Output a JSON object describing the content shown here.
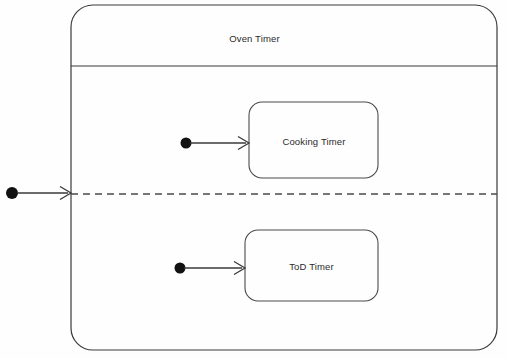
{
  "diagram": {
    "type": "uml-state-machine",
    "title": "Oven Timer",
    "background_color": "#fefefe",
    "stroke_color": "#3a3a3a",
    "text_color": "#2b2b2b",
    "composite_state": {
      "name": "Oven Timer",
      "x": 71,
      "y": 5,
      "width": 426,
      "height": 345,
      "corner_radius": 22,
      "title_divider_y": 66
    },
    "region_separator": {
      "name": "orthogonal-region-separator",
      "style": "dashed",
      "y": 194,
      "x1": 71,
      "x2": 497
    },
    "regions": [
      {
        "name": "cooking-region",
        "state": {
          "name": "Cooking Timer",
          "x": 249,
          "y": 102,
          "width": 129,
          "height": 76,
          "corner_radius": 13
        },
        "initial_pseudostate": {
          "cx": 186,
          "cy": 143,
          "r": 5.5
        },
        "transition": {
          "x1": 192,
          "y1": 143,
          "x2": 248,
          "y2": 143
        }
      },
      {
        "name": "tod-region",
        "state": {
          "name": "ToD Timer",
          "x": 245,
          "y": 230,
          "width": 133,
          "height": 71,
          "corner_radius": 13
        },
        "initial_pseudostate": {
          "cx": 180,
          "cy": 268,
          "r": 5.5
        },
        "transition": {
          "x1": 186,
          "y1": 268,
          "x2": 244,
          "y2": 268
        }
      }
    ],
    "entry_point": {
      "name": "initial-pseudostate-oven-timer",
      "initial_pseudostate": {
        "cx": 12,
        "cy": 193,
        "r": 6
      },
      "transition": {
        "x1": 18,
        "y1": 193,
        "x2": 70,
        "y2": 193
      }
    }
  }
}
